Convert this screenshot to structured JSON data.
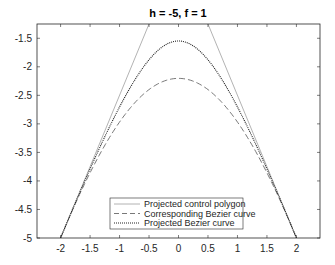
{
  "chart_data": {
    "type": "line",
    "title": "h = -5, f = 1",
    "xlabel": "",
    "ylabel": "",
    "xlim": [
      -2.4,
      2.4
    ],
    "ylim": [
      -5,
      -1.25
    ],
    "xticks": [
      -2,
      -1.5,
      -1,
      -0.5,
      0,
      0.5,
      1,
      1.5,
      2
    ],
    "xtick_labels": [
      "-2",
      "-1.5",
      "-1",
      "-0.5",
      "0",
      "0.5",
      "1",
      "1.5",
      "2"
    ],
    "yticks": [
      -5,
      -4.5,
      -4,
      -3.5,
      -3,
      -2.5,
      -2,
      -1.5
    ],
    "ytick_labels": [
      "-5",
      "-4.5",
      "-4",
      "-3.5",
      "-3",
      "-2.5",
      "-2",
      "-1.5"
    ],
    "grid": false,
    "legend_position": "south",
    "control_points": [
      [
        -2,
        -5
      ],
      [
        0,
        0
      ],
      [
        2,
        -5
      ]
    ],
    "series": [
      {
        "name": "Projected control polygon",
        "style": "solid",
        "color": "#a0a0a0",
        "x": [
          -2,
          0,
          2
        ],
        "y": [
          -5,
          0,
          -5
        ]
      },
      {
        "name": "Corresponding Bezier curve",
        "style": "dashed",
        "color": "#555555",
        "middle_weight": 1.27,
        "peak": [
          0,
          -2.2
        ],
        "x": [
          -2,
          -1.5,
          -1,
          -0.5,
          0,
          0.5,
          1,
          1.5,
          2
        ],
        "y": [
          -5,
          -3.85,
          -2.95,
          -2.4,
          -2.2,
          -2.4,
          -2.95,
          -3.85,
          -5
        ]
      },
      {
        "name": "Projected Bezier curve",
        "style": "dotted",
        "color": "#222222",
        "middle_weight": 2.23,
        "peak": [
          0,
          -1.55
        ],
        "x": [
          -2,
          -1.5,
          -1,
          -0.5,
          0,
          0.5,
          1,
          1.5,
          2
        ],
        "y": [
          -5,
          -3.75,
          -2.55,
          -1.85,
          -1.55,
          -1.85,
          -2.55,
          -3.75,
          -5
        ]
      }
    ]
  },
  "legend": {
    "items": [
      {
        "label": "Projected control polygon"
      },
      {
        "label": "Corresponding Bezier curve"
      },
      {
        "label": "Projected Bezier curve"
      }
    ]
  }
}
